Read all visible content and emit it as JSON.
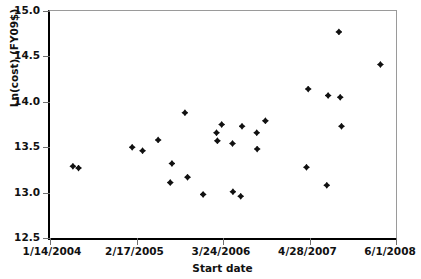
{
  "chart_data": {
    "type": "scatter",
    "title": "",
    "xlabel": "Start date",
    "ylabel": "Ln(cost) (FY09$)",
    "ylim": [
      12.5,
      15.0
    ],
    "ytick_labels": [
      "15.0",
      "14.5",
      "14.0",
      "13.5",
      "13.0",
      "12.5"
    ],
    "ytick_values": [
      15.0,
      14.5,
      14.0,
      13.5,
      13.0,
      12.5
    ],
    "xtick_labels": [
      "1/14/2004",
      "2/17/2005",
      "3/24/2006",
      "4/28/2007",
      "6/1/2008"
    ],
    "xtick_positions": [
      0,
      1,
      2,
      3,
      4
    ],
    "xlim": [
      0,
      4
    ],
    "grid": false,
    "legend": null,
    "marker": "diamond",
    "marker_color": "#111111",
    "points": [
      {
        "x": 0.265,
        "y": 13.29
      },
      {
        "x": 0.33,
        "y": 13.27
      },
      {
        "x": 0.95,
        "y": 13.5
      },
      {
        "x": 1.07,
        "y": 13.46
      },
      {
        "x": 1.25,
        "y": 13.58
      },
      {
        "x": 1.39,
        "y": 13.11
      },
      {
        "x": 1.41,
        "y": 13.32
      },
      {
        "x": 1.56,
        "y": 13.88
      },
      {
        "x": 1.59,
        "y": 13.17
      },
      {
        "x": 1.77,
        "y": 12.98
      },
      {
        "x": 1.925,
        "y": 13.66
      },
      {
        "x": 1.935,
        "y": 13.57
      },
      {
        "x": 1.985,
        "y": 13.75
      },
      {
        "x": 2.11,
        "y": 13.54
      },
      {
        "x": 2.115,
        "y": 13.01
      },
      {
        "x": 2.205,
        "y": 12.96
      },
      {
        "x": 2.22,
        "y": 13.73
      },
      {
        "x": 2.39,
        "y": 13.66
      },
      {
        "x": 2.395,
        "y": 13.48
      },
      {
        "x": 2.49,
        "y": 13.79
      },
      {
        "x": 2.965,
        "y": 13.28
      },
      {
        "x": 2.985,
        "y": 14.14
      },
      {
        "x": 3.2,
        "y": 13.08
      },
      {
        "x": 3.215,
        "y": 14.07
      },
      {
        "x": 3.34,
        "y": 14.77
      },
      {
        "x": 3.355,
        "y": 14.05
      },
      {
        "x": 3.37,
        "y": 13.73
      },
      {
        "x": 3.82,
        "y": 14.41
      }
    ]
  },
  "figure": {
    "axis_color": "#000000",
    "tick_color": "#6f6f6f",
    "background": "#ffffff"
  }
}
